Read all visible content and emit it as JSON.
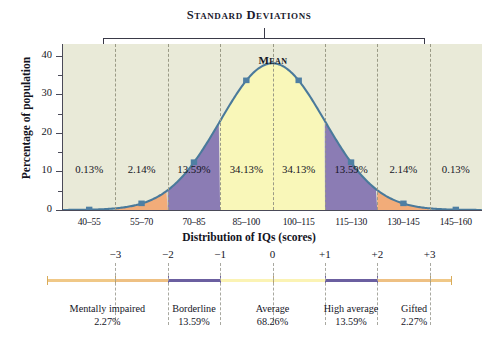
{
  "header": {
    "standard_deviations_title": "Standard Deviations"
  },
  "axes": {
    "ylabel": "Percentage of population",
    "xlabel": "Distribution of IQs (scores)",
    "yticks": [
      "0",
      "10",
      "20",
      "30",
      "40"
    ],
    "mean_label": "Mean"
  },
  "chart_data": {
    "type": "area",
    "title": "Distribution of IQs (scores)",
    "xlabel": "Distribution of IQs (scores)",
    "ylabel": "Percentage of population",
    "ylim": [
      0,
      43
    ],
    "yticks": [
      0,
      10,
      20,
      30,
      40
    ],
    "grid": true,
    "legend": "none",
    "categories": [
      "40–55",
      "55–70",
      "70–85",
      "85–100",
      "100–115",
      "115–130",
      "130–145",
      "145–160"
    ],
    "values": [
      0.13,
      2.14,
      13.59,
      34.13,
      34.13,
      13.59,
      2.14,
      0.13
    ],
    "bin_labels": [
      "0.13%",
      "2.14%",
      "13.59%",
      "34.13%",
      "34.13%",
      "13.59%",
      "2.14%",
      "0.13%"
    ],
    "sd_ticks": [
      "−3",
      "−2",
      "−1",
      "0",
      "+1",
      "+2",
      "+3"
    ],
    "curve_peak_percent": 38,
    "marker_points_percent": [
      1.2,
      2.6,
      13.5,
      35.5,
      35.5,
      13.5,
      2.6,
      1.2
    ],
    "region_colors": {
      "outer": "#e9ead8",
      "orange": "#f2ac79",
      "purple": "#8b7cb4",
      "yellow": "#f9f7b9",
      "curve_line": "#4a7a9b"
    },
    "annotations": [
      {
        "label": "Mentally impaired",
        "value": "2.27%"
      },
      {
        "label": "Borderline",
        "value": "13.59%"
      },
      {
        "label": "Average",
        "value": "68.26%"
      },
      {
        "label": "High average",
        "value": "13.59%"
      },
      {
        "label": "Gifted",
        "value": "2.27%"
      }
    ]
  },
  "categories_bottom": [
    {
      "name": "Mentally impaired",
      "percent": "2.27%"
    },
    {
      "name": "Borderline",
      "percent": "13.59%"
    },
    {
      "name": "Average",
      "percent": "68.26%"
    },
    {
      "name": "High average",
      "percent": "13.59%"
    },
    {
      "name": "Gifted",
      "percent": "2.27%"
    }
  ]
}
